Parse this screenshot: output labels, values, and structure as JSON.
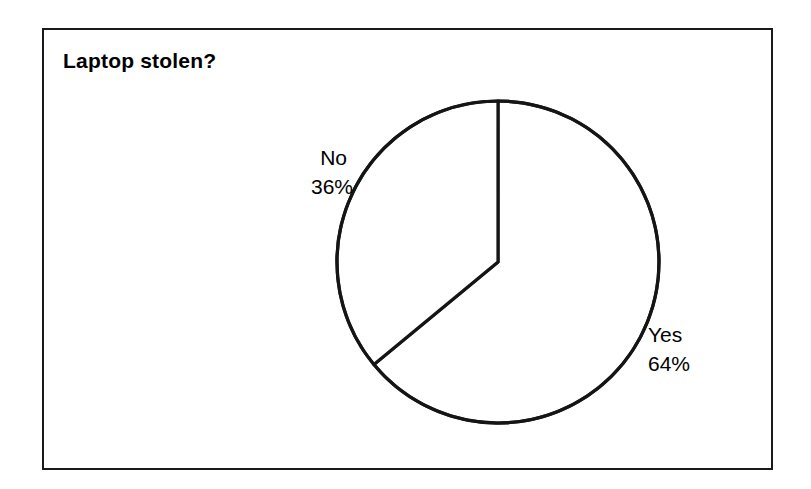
{
  "figure": {
    "title": "Laptop stolen?",
    "border_color": "#1a1a1a",
    "background_color": "#ffffff",
    "stroke_color": "#000000"
  },
  "labels": {
    "no": {
      "name": "No",
      "percent": "36%"
    },
    "yes": {
      "name": "Yes",
      "percent": "64%"
    }
  },
  "chart_data": {
    "type": "pie",
    "title": "Laptop stolen?",
    "categories": [
      "Yes",
      "No"
    ],
    "values": [
      64,
      36
    ],
    "value_labels": [
      "64%",
      "36%"
    ],
    "units": "percent",
    "total": 100,
    "slices": [
      {
        "label": "Yes",
        "value": 64,
        "value_label": "64%",
        "start_angle_deg": 0,
        "end_angle_deg": 230.4,
        "fill": "#ffffff",
        "stroke": "#000000",
        "label_position": "outside-right"
      },
      {
        "label": "No",
        "value": 36,
        "value_label": "36%",
        "start_angle_deg": 230.4,
        "end_angle_deg": 360,
        "fill": "#ffffff",
        "stroke": "#000000",
        "label_position": "outside-left"
      }
    ],
    "start_angle_deg": 0,
    "direction": "clockwise",
    "legend": false,
    "grid": false,
    "xlabel": "",
    "ylabel": ""
  }
}
